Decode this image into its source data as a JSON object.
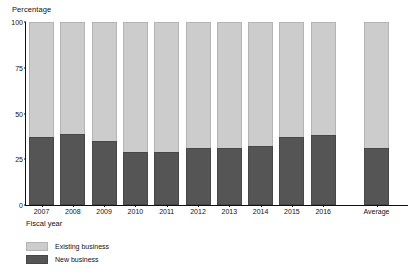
{
  "chart_data": {
    "type": "bar",
    "stacked": true,
    "title": "",
    "subtitle": "",
    "xlabel": "Fiscal year",
    "ylabel": "Percentage",
    "ylim": [
      0,
      100
    ],
    "yticks": [
      0,
      25,
      50,
      75,
      100
    ],
    "ytick_labels": [
      "0",
      "25",
      "50",
      "75",
      "100"
    ],
    "grid": false,
    "legend_position": "bottom-left",
    "categories": [
      "2007",
      "2008",
      "2009",
      "2010",
      "2011",
      "2012",
      "2013",
      "2014",
      "2015",
      "2016",
      "Average"
    ],
    "series": [
      {
        "name": "New business",
        "color": "#555555",
        "values": [
          37,
          39,
          35,
          29,
          29,
          31,
          31,
          32,
          37,
          38,
          31
        ]
      },
      {
        "name": "Existing business",
        "color": "#cccccc",
        "values": [
          63,
          61,
          65,
          71,
          71,
          69,
          69,
          68,
          63,
          62,
          69
        ]
      }
    ],
    "legend": [
      "Existing business",
      "New business"
    ],
    "annotations": []
  },
  "axes": {
    "y_title": "Percentage",
    "x_title": "Fiscal year"
  },
  "legend": {
    "items": [
      {
        "label": "Existing business",
        "swatch": "existing"
      },
      {
        "label": "New business",
        "swatch": "new"
      }
    ]
  }
}
